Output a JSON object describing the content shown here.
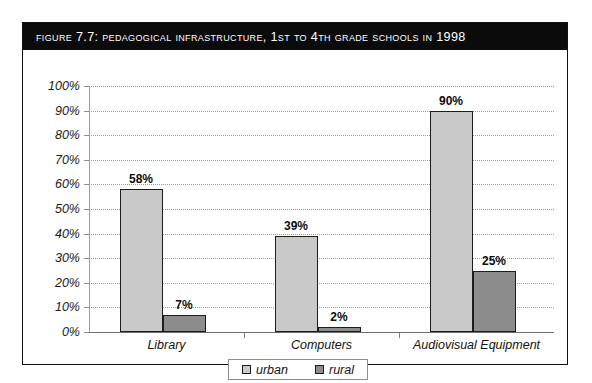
{
  "figure": {
    "caption": "Figure 7.7:  Pedagogical Infrastructure, 1st to 4th Grade Schools in 1998"
  },
  "legend": {
    "position": "bottom-center",
    "entries": [
      {
        "label": "urban",
        "color": "#c9c9c9",
        "swatch": "urban-swatch-icon"
      },
      {
        "label": "rural",
        "color": "#8d8d8d",
        "swatch": "rural-swatch-icon"
      }
    ]
  },
  "chart_data": {
    "type": "bar",
    "title": "Figure 7.7:  Pedagogical Infrastructure, 1st to 4th Grade Schools in 1998",
    "xlabel": "",
    "ylabel": "",
    "categories": [
      "Library",
      "Computers",
      "Audiovisual Equipment"
    ],
    "series": [
      {
        "name": "urban",
        "color": "#c9c9c9",
        "values": [
          58,
          39,
          90
        ],
        "value_labels": [
          "58%",
          "39%",
          "90%"
        ]
      },
      {
        "name": "rural",
        "color": "#8d8d8d",
        "values": [
          7,
          2,
          25
        ],
        "value_labels": [
          "7%",
          "2%",
          "25%"
        ]
      }
    ],
    "ylim": [
      0,
      100
    ],
    "ytick_values": [
      0,
      10,
      20,
      30,
      40,
      50,
      60,
      70,
      80,
      90,
      100
    ],
    "ytick_labels": [
      "0%",
      "10%",
      "20%",
      "30%",
      "40%",
      "50%",
      "60%",
      "70%",
      "80%",
      "90%",
      "100%"
    ],
    "grid": true,
    "grid_style": "dotted-horizontal",
    "legend_position": "bottom-center"
  }
}
